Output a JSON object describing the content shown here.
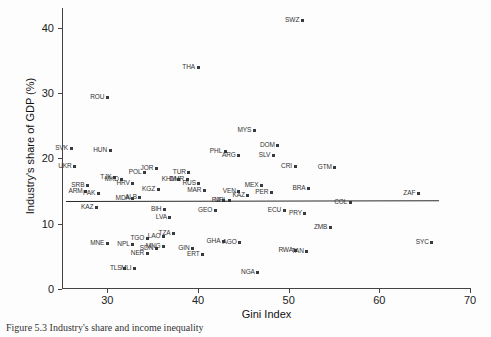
{
  "figure": {
    "caption": "Figure 5.3   Industry's share and income inequality"
  },
  "chart_data": {
    "type": "scatter",
    "title": "",
    "xlabel": "Gini Index",
    "ylabel": "Industry's share of GDP (%)",
    "xlim": [
      25,
      70
    ],
    "ylim": [
      0,
      43
    ],
    "xticks": [
      30,
      40,
      50,
      60,
      70
    ],
    "yticks": [
      0,
      10,
      20,
      30,
      40
    ],
    "grid": false,
    "legend": "none",
    "point_label_field": "code",
    "fit_line": {
      "label": "linear fit",
      "x_start": 25.4,
      "y_start": 13.5,
      "x_end": 66.5,
      "y_end": 13.6
    },
    "points": [
      {
        "code": "SWZ",
        "x": 51.5,
        "y": 41.1
      },
      {
        "code": "THA",
        "x": 40.0,
        "y": 33.9
      },
      {
        "code": "ROU",
        "x": 30.0,
        "y": 29.3
      },
      {
        "code": "MYS",
        "x": 46.2,
        "y": 24.3
      },
      {
        "code": "DOM",
        "x": 48.8,
        "y": 21.9
      },
      {
        "code": "SVK",
        "x": 26.0,
        "y": 21.5
      },
      {
        "code": "HUN",
        "x": 30.3,
        "y": 21.2
      },
      {
        "code": "PHL",
        "x": 43.0,
        "y": 21.0
      },
      {
        "code": "ARG",
        "x": 44.5,
        "y": 20.4
      },
      {
        "code": "SLV",
        "x": 48.3,
        "y": 20.4
      },
      {
        "code": "UKR",
        "x": 26.4,
        "y": 18.8
      },
      {
        "code": "CRI",
        "x": 50.7,
        "y": 18.7
      },
      {
        "code": "JOR",
        "x": 35.4,
        "y": 18.5
      },
      {
        "code": "GTM",
        "x": 55.1,
        "y": 18.6
      },
      {
        "code": "TUR",
        "x": 39.0,
        "y": 17.9
      },
      {
        "code": "POL",
        "x": 34.1,
        "y": 17.8
      },
      {
        "code": "TJK",
        "x": 30.8,
        "y": 17.0
      },
      {
        "code": "MKD",
        "x": 31.6,
        "y": 16.8
      },
      {
        "code": "KHM",
        "x": 37.9,
        "y": 16.8
      },
      {
        "code": "DMR",
        "x": 38.8,
        "y": 16.8
      },
      {
        "code": "RUS",
        "x": 40.1,
        "y": 16.2
      },
      {
        "code": "HRV",
        "x": 32.8,
        "y": 16.2
      },
      {
        "code": "SRB",
        "x": 27.8,
        "y": 15.9
      },
      {
        "code": "MEX",
        "x": 47.0,
        "y": 15.9
      },
      {
        "code": "BRA",
        "x": 52.2,
        "y": 15.4
      },
      {
        "code": "KGZ",
        "x": 35.6,
        "y": 15.2
      },
      {
        "code": "MAR",
        "x": 40.7,
        "y": 15.0
      },
      {
        "code": "ARM",
        "x": 27.6,
        "y": 14.9
      },
      {
        "code": "VEN",
        "x": 44.5,
        "y": 14.9
      },
      {
        "code": "PAK",
        "x": 29.0,
        "y": 14.6
      },
      {
        "code": "PER",
        "x": 48.1,
        "y": 14.7
      },
      {
        "code": "ZAF",
        "x": 64.3,
        "y": 14.6
      },
      {
        "code": "KAZ2",
        "x": 45.5,
        "y": 14.3
      },
      {
        "code": "ALB",
        "x": 33.6,
        "y": 14.0
      },
      {
        "code": "MDA",
        "x": 32.8,
        "y": 13.8
      },
      {
        "code": "FJI",
        "x": 42.8,
        "y": 13.6
      },
      {
        "code": "NPL2",
        "x": 43.5,
        "y": 13.5
      },
      {
        "code": "COL",
        "x": 56.8,
        "y": 13.3
      },
      {
        "code": "KAZ",
        "x": 28.8,
        "y": 12.5
      },
      {
        "code": "BIH",
        "x": 36.3,
        "y": 12.2
      },
      {
        "code": "GEO",
        "x": 41.9,
        "y": 12.0
      },
      {
        "code": "ECU",
        "x": 49.5,
        "y": 12.0
      },
      {
        "code": "PRY",
        "x": 51.8,
        "y": 11.6
      },
      {
        "code": "LVA",
        "x": 36.9,
        "y": 10.9
      },
      {
        "code": "ZMB",
        "x": 54.6,
        "y": 9.4
      },
      {
        "code": "TZA",
        "x": 37.3,
        "y": 8.5
      },
      {
        "code": "LAO",
        "x": 36.2,
        "y": 8.0
      },
      {
        "code": "TGO",
        "x": 34.4,
        "y": 7.7
      },
      {
        "code": "GHA",
        "x": 42.8,
        "y": 7.3
      },
      {
        "code": "AGO",
        "x": 44.6,
        "y": 7.1
      },
      {
        "code": "SYC",
        "x": 65.8,
        "y": 7.1
      },
      {
        "code": "MNE",
        "x": 30.0,
        "y": 7.0
      },
      {
        "code": "NPL",
        "x": 32.8,
        "y": 6.8
      },
      {
        "code": "MNG",
        "x": 36.2,
        "y": 6.5
      },
      {
        "code": "SDN",
        "x": 35.4,
        "y": 6.2
      },
      {
        "code": "GIN",
        "x": 39.4,
        "y": 6.2
      },
      {
        "code": "RWA",
        "x": 50.8,
        "y": 5.9
      },
      {
        "code": "TAN",
        "x": 52.0,
        "y": 5.8
      },
      {
        "code": "NER",
        "x": 34.4,
        "y": 5.4
      },
      {
        "code": "ERT",
        "x": 40.5,
        "y": 5.3
      },
      {
        "code": "TLS",
        "x": 31.9,
        "y": 3.2
      },
      {
        "code": "MLI",
        "x": 33.0,
        "y": 3.1
      },
      {
        "code": "NGA",
        "x": 46.6,
        "y": 2.6
      }
    ]
  }
}
